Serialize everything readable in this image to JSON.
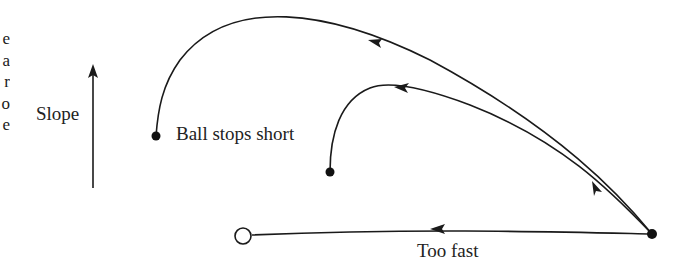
{
  "figure": {
    "type": "putting-trajectory-diagram",
    "axis_label": "Slope",
    "axis_direction": "up",
    "trajectories": [
      {
        "id": "large-arc",
        "label": "Ball stops short",
        "start": "ball-right",
        "end": "stop-point-1"
      },
      {
        "id": "small-arc",
        "label": "",
        "start": "ball-right",
        "end": "stop-point-2"
      },
      {
        "id": "straight",
        "label": "Too fast",
        "start": "ball-right",
        "end": "hole"
      }
    ],
    "labels": {
      "slope": "Slope",
      "ball_stops_short": "Ball stops short",
      "too_fast": "Too fast"
    },
    "edge_text_fragments": [
      "e",
      "a",
      "r",
      "o",
      "e"
    ]
  }
}
